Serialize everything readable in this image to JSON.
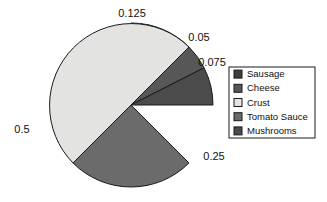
{
  "chart_data": {
    "type": "pie",
    "title": "",
    "labels": [
      "Sausage",
      "Cheese",
      "Crust",
      "Tomato Sauce",
      "Mushrooms"
    ],
    "values": [
      0.125,
      0.05,
      0.5,
      0.25,
      0.075
    ],
    "value_labels": [
      "0.125",
      "0.05",
      "0.5",
      "0.25",
      "0.075"
    ],
    "colors": [
      "#3f3f3f",
      "#575757",
      "#e3e3e1",
      "#6b6b6b",
      "#4b4b4b"
    ],
    "start_angles_deg": [
      0,
      45,
      225,
      135,
      63
    ],
    "sweep_angles_deg": [
      45,
      18,
      180,
      90,
      27
    ],
    "legend_position": "right",
    "grid": false,
    "total": 1.0,
    "label_positions": [
      {
        "text": "0.125",
        "x": 132,
        "y": 14,
        "anchor": "middle"
      },
      {
        "text": "0.05",
        "x": 199,
        "y": 38,
        "anchor": "middle"
      },
      {
        "text": "0.075",
        "x": 212,
        "y": 63,
        "anchor": "middle"
      },
      {
        "text": "0.25",
        "x": 214,
        "y": 157,
        "anchor": "middle"
      },
      {
        "text": "0.5",
        "x": 22,
        "y": 130,
        "anchor": "middle"
      }
    ]
  },
  "pie": {
    "center_x": 131,
    "center_y": 105,
    "radius": 82,
    "outline_color": "#1a1a1a"
  },
  "legend": {
    "box": {
      "x": 229,
      "y": 67,
      "width": 86,
      "height": 71
    },
    "items": [
      {
        "label": "Sausage",
        "color": "#3f3f3f"
      },
      {
        "label": "Cheese",
        "color": "#575757"
      },
      {
        "label": "Crust",
        "color": "#e3e3e1"
      },
      {
        "label": "Tomato Sauce",
        "color": "#6b6b6b"
      },
      {
        "label": "Mushrooms",
        "color": "#4b4b4b"
      }
    ]
  },
  "canvas": {
    "width": 327,
    "height": 202,
    "background": "#ffffff"
  }
}
